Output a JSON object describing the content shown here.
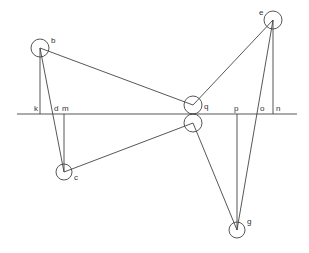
{
  "diagram": {
    "baseline": {
      "x1": 17,
      "y": 114,
      "x2": 297
    },
    "nodes": [
      {
        "id": "b",
        "label": "b",
        "cx": 40,
        "cy": 48,
        "r": 9,
        "lx": 51,
        "ly": 43
      },
      {
        "id": "e",
        "label": "e",
        "cx": 273,
        "cy": 20,
        "r": 9,
        "lx": 259,
        "ly": 15
      },
      {
        "id": "c",
        "label": "c",
        "cx": 64,
        "cy": 172,
        "r": 8,
        "lx": 74,
        "ly": 180
      },
      {
        "id": "g",
        "label": "g",
        "cx": 237,
        "cy": 230,
        "r": 8,
        "lx": 247,
        "ly": 224
      },
      {
        "id": "q-upper",
        "label": "q",
        "cx": 193,
        "cy": 105,
        "r": 9,
        "lx": 204,
        "ly": 109
      },
      {
        "id": "q-lower",
        "label": "",
        "cx": 193,
        "cy": 123,
        "r": 9,
        "lx": 0,
        "ly": 0
      }
    ],
    "segments": [
      {
        "from": [
          40,
          48
        ],
        "to": [
          193,
          105
        ]
      },
      {
        "from": [
          193,
          105
        ],
        "to": [
          273,
          20
        ]
      },
      {
        "from": [
          40,
          48
        ],
        "to": [
          64,
          172
        ]
      },
      {
        "from": [
          64,
          172
        ],
        "to": [
          193,
          123
        ]
      },
      {
        "from": [
          193,
          123
        ],
        "to": [
          237,
          230
        ]
      },
      {
        "from": [
          237,
          230
        ],
        "to": [
          273,
          20
        ]
      },
      {
        "from": [
          40,
          48
        ],
        "to": [
          40,
          114
        ]
      },
      {
        "from": [
          64,
          114
        ],
        "to": [
          64,
          172
        ]
      },
      {
        "from": [
          237,
          114
        ],
        "to": [
          237,
          230
        ]
      },
      {
        "from": [
          273,
          20
        ],
        "to": [
          273,
          114
        ]
      }
    ],
    "baseline_labels": [
      {
        "label": "k",
        "x": 34,
        "y": 111
      },
      {
        "label": "d",
        "x": 54,
        "y": 111
      },
      {
        "label": "m",
        "x": 62,
        "y": 111
      },
      {
        "label": "p",
        "x": 234,
        "y": 111
      },
      {
        "label": "o",
        "x": 260,
        "y": 111
      },
      {
        "label": "n",
        "x": 276,
        "y": 111
      }
    ]
  }
}
